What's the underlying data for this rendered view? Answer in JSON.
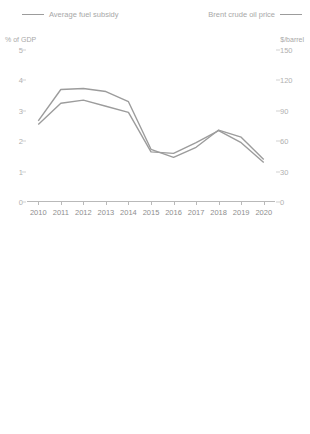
{
  "top": {
    "legend": [
      {
        "label": "Average fuel subsidy",
        "color": "#9c9c9c",
        "side": "left"
      },
      {
        "label": "Brent crude oil price",
        "color": "#9c9c9c",
        "side": "right"
      }
    ],
    "ylabel_left": "% of GDP",
    "ylabel_right": "$/barrel"
  },
  "bottom": {
    "legend": [
      {
        "label": "2010",
        "marker": "circle"
      },
      {
        "label": "2020",
        "marker": "bar"
      }
    ],
    "ylabel": "% of GDP"
  },
  "chart_data": [
    {
      "type": "line",
      "title": "",
      "xlabel": "",
      "ylabel": "% of GDP",
      "y2label": "$/barrel",
      "grid": false,
      "legend_position": "top",
      "x": [
        "2010",
        "2011",
        "2012",
        "2013",
        "2014",
        "2015",
        "2016",
        "2017",
        "2018",
        "2019",
        "2020"
      ],
      "yticks": [
        0,
        1,
        2,
        3,
        4,
        5
      ],
      "ylim": [
        0,
        5
      ],
      "y2ticks": [
        0,
        30,
        60,
        90,
        120,
        150
      ],
      "y2lim": [
        0,
        150
      ],
      "series": [
        {
          "name": "Average fuel subsidy",
          "axis": "left",
          "values": [
            2.55,
            3.25,
            3.35,
            3.15,
            2.95,
            1.65,
            1.6,
            1.95,
            2.35,
            1.95,
            1.3
          ]
        },
        {
          "name": "Brent crude oil price",
          "axis": "right",
          "values": [
            80,
            111,
            112,
            109,
            99,
            52,
            44,
            54,
            71,
            64,
            42
          ]
        }
      ]
    },
    {
      "type": "bar",
      "title": "",
      "xlabel": "",
      "ylabel": "% of GDP",
      "grid": false,
      "legend_position": "top",
      "yticks": [
        0,
        2,
        4,
        6,
        8,
        10,
        12
      ],
      "ylim": [
        0,
        12
      ],
      "categories": [
        "UZB",
        "TKM",
        "KAZ",
        "AZE",
        "IND",
        "INO",
        "PAK",
        "BRU",
        "BAN",
        "SRI",
        "PRC",
        "THA",
        "VIE",
        "TAP",
        "MAL",
        "ROK"
      ],
      "series": [
        {
          "name": "2020",
          "marker": "bar",
          "values": [
            6.2,
            3.5,
            2.4,
            2.35,
            1.5,
            1.35,
            1.1,
            0.95,
            0.75,
            0.55,
            0.45,
            0.4,
            0.3,
            0.2,
            0.15,
            0.1
          ]
        },
        {
          "name": "2010",
          "marker": "circle",
          "values": [
            8.1,
            11.5,
            1.0,
            0.75,
            0.25,
            1.35,
            0.15,
            2.1,
            0.35,
            1.25,
            0.25,
            3.2,
            0.85,
            0.15,
            1.5,
            0.1
          ]
        }
      ]
    }
  ]
}
